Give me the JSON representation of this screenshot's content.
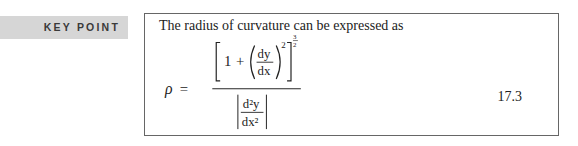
{
  "sidebar": {
    "label": "KEY POINT"
  },
  "box": {
    "intro": "The radius of curvature can be expressed as",
    "equation_number": "17.3",
    "formula": {
      "lhs": "ρ",
      "equals": "=",
      "numerator": {
        "one": "1",
        "plus": "+",
        "dy": "dy",
        "dx": "dx",
        "inner_exp": "2",
        "outer_exp_num": "3",
        "outer_exp_den": "2"
      },
      "denominator": {
        "d2y": "d²y",
        "dx2": "dx²"
      }
    }
  }
}
